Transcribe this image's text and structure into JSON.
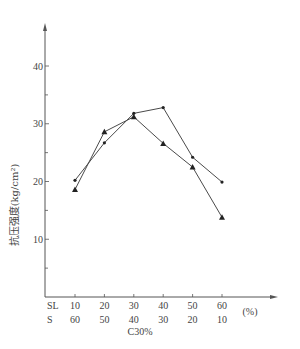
{
  "chart_data": {
    "type": "line",
    "title": "",
    "ylabel": "抗压强度(kg/cm²)",
    "xlabel": "C30%",
    "x_unit": "(%)",
    "x_rows": [
      {
        "label": "SL",
        "values": [
          "10",
          "20",
          "30",
          "40",
          "50",
          "60"
        ]
      },
      {
        "label": "S",
        "values": [
          "60",
          "50",
          "40",
          "30",
          "20",
          "10"
        ]
      }
    ],
    "categories": [
      "10",
      "20",
      "30",
      "40",
      "50",
      "60"
    ],
    "yticks": [
      "10",
      "20",
      "30",
      "40"
    ],
    "ylim": [
      0,
      45
    ],
    "grid": false,
    "legend": null,
    "series": [
      {
        "name": "circle-marker series",
        "marker": "circle",
        "values": [
          20.2,
          26.7,
          31.8,
          32.8,
          24.2,
          19.9
        ]
      },
      {
        "name": "triangle-marker series",
        "marker": "triangle",
        "values": [
          18.6,
          28.6,
          31.2,
          26.6,
          22.5,
          13.8
        ]
      }
    ]
  },
  "colors": {
    "line": "#4a4a4a",
    "axis": "#555555",
    "text": "#444444"
  }
}
